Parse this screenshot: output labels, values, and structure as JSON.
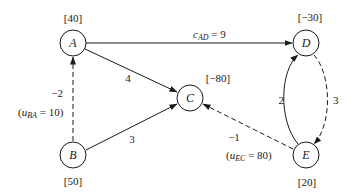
{
  "diagram": {
    "type": "network-flow",
    "nodes": [
      {
        "id": "A",
        "label": "A",
        "supply": "[40]"
      },
      {
        "id": "B",
        "label": "B",
        "supply": "[50]"
      },
      {
        "id": "C",
        "label": "C",
        "supply": "[−80]"
      },
      {
        "id": "D",
        "label": "D",
        "supply": "[−30]"
      },
      {
        "id": "E",
        "label": "E",
        "supply": "[20]"
      }
    ],
    "edges": [
      {
        "from": "A",
        "to": "D",
        "style": "solid",
        "cost_var": "c",
        "cost_sub": "AD",
        "cost_eq": " = 9"
      },
      {
        "from": "A",
        "to": "C",
        "style": "solid",
        "cost": "4"
      },
      {
        "from": "B",
        "to": "C",
        "style": "solid",
        "cost": "3"
      },
      {
        "from": "B",
        "to": "A",
        "style": "dashed",
        "cost": "−2",
        "cap_open": "(",
        "cap_var": "u",
        "cap_sub": "BA",
        "cap_eq": " = 10)"
      },
      {
        "from": "E",
        "to": "D",
        "style": "solid",
        "cost": "2"
      },
      {
        "from": "D",
        "to": "E",
        "style": "dashed",
        "cost": "3"
      },
      {
        "from": "E",
        "to": "C",
        "style": "dashed",
        "cost": "−1",
        "cap_open": "(",
        "cap_var": "u",
        "cap_sub": "EC",
        "cap_eq": " = 80)"
      }
    ]
  }
}
